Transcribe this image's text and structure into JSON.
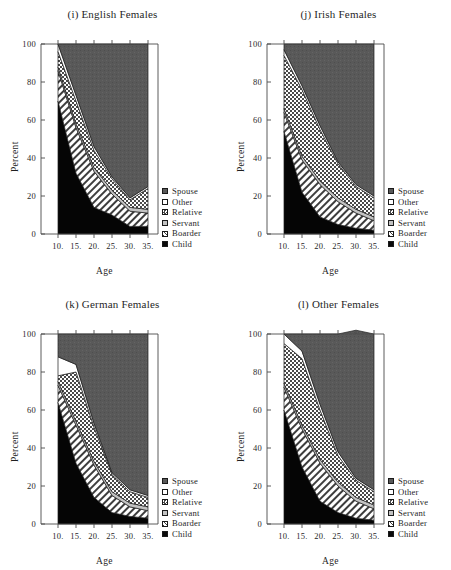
{
  "figure": {
    "ylabel": "Percent",
    "xlabel": "Age",
    "y_ticks": [
      "0",
      "20",
      "40",
      "60",
      "80",
      "100"
    ],
    "x_ticks": [
      "10.",
      "15.",
      "20.",
      "25.",
      "30.",
      "35."
    ],
    "legend": [
      {
        "label": "Spouse",
        "pattern": "solid-dark",
        "color": "#595959"
      },
      {
        "label": "Other",
        "pattern": "empty",
        "color": "#ffffff"
      },
      {
        "label": "Relative",
        "pattern": "checker",
        "color": "#d9d9d9"
      },
      {
        "label": "Servant",
        "pattern": "hatch-light",
        "color": "#cccccc"
      },
      {
        "label": "Boarder",
        "pattern": "hatch-diag",
        "color": "#e0e0e0"
      },
      {
        "label": "Child",
        "pattern": "solid-black",
        "color": "#000000"
      }
    ]
  },
  "chart_data": [
    {
      "type": "area",
      "title": "(i) English Females",
      "xlabel": "Age",
      "ylabel": "Percent",
      "x": [
        10,
        15,
        20,
        25,
        30,
        35
      ],
      "xlim": [
        10,
        35
      ],
      "ylim": [
        0,
        100
      ],
      "grid": false,
      "legend_position": "right",
      "series": [
        {
          "name": "Child",
          "values": [
            70,
            32,
            14,
            10,
            4,
            4
          ]
        },
        {
          "name": "Boarder",
          "values": [
            16,
            24,
            19,
            11,
            8,
            7
          ]
        },
        {
          "name": "Servant",
          "values": [
            2,
            2,
            2,
            2,
            2,
            2
          ]
        },
        {
          "name": "Relative",
          "values": [
            8,
            12,
            9,
            6,
            4,
            11
          ]
        },
        {
          "name": "Other",
          "values": [
            4,
            3,
            2,
            1,
            1,
            1
          ]
        },
        {
          "name": "Spouse",
          "values": [
            0,
            27,
            54,
            70,
            81,
            75
          ]
        }
      ]
    },
    {
      "type": "area",
      "title": "(j) Irish Females",
      "xlabel": "Age",
      "ylabel": "Percent",
      "x": [
        10,
        15,
        20,
        25,
        30,
        35
      ],
      "xlim": [
        10,
        35
      ],
      "ylim": [
        0,
        100
      ],
      "grid": false,
      "legend_position": "right",
      "series": [
        {
          "name": "Child",
          "values": [
            54,
            22,
            9,
            5,
            3,
            2
          ]
        },
        {
          "name": "Boarder",
          "values": [
            10,
            17,
            17,
            12,
            8,
            5
          ]
        },
        {
          "name": "Servant",
          "values": [
            2,
            2,
            2,
            2,
            2,
            2
          ]
        },
        {
          "name": "Relative",
          "values": [
            28,
            35,
            27,
            18,
            12,
            10
          ]
        },
        {
          "name": "Other",
          "values": [
            3,
            2,
            2,
            1,
            1,
            1
          ]
        },
        {
          "name": "Spouse",
          "values": [
            3,
            22,
            43,
            62,
            74,
            80
          ]
        }
      ]
    },
    {
      "type": "area",
      "title": "(k) German Females",
      "xlabel": "Age",
      "ylabel": "Percent",
      "x": [
        10,
        15,
        20,
        25,
        30,
        35
      ],
      "xlim": [
        10,
        35
      ],
      "ylim": [
        0,
        100
      ],
      "grid": false,
      "legend_position": "right",
      "series": [
        {
          "name": "Child",
          "values": [
            64,
            32,
            14,
            6,
            4,
            3
          ]
        },
        {
          "name": "Boarder",
          "values": [
            9,
            20,
            17,
            9,
            5,
            4
          ]
        },
        {
          "name": "Servant",
          "values": [
            2,
            2,
            2,
            2,
            2,
            2
          ]
        },
        {
          "name": "Relative",
          "values": [
            3,
            26,
            18,
            9,
            6,
            5
          ]
        },
        {
          "name": "Other",
          "values": [
            10,
            4,
            2,
            1,
            1,
            1
          ]
        },
        {
          "name": "Spouse",
          "values": [
            12,
            16,
            47,
            73,
            82,
            85
          ]
        }
      ]
    },
    {
      "type": "area",
      "title": "(l) Other Females",
      "xlabel": "Age",
      "ylabel": "Percent",
      "x": [
        10,
        15,
        20,
        25,
        30,
        35
      ],
      "xlim": [
        10,
        35
      ],
      "ylim": [
        0,
        100
      ],
      "grid": false,
      "legend_position": "right",
      "series": [
        {
          "name": "Child",
          "values": [
            60,
            30,
            12,
            6,
            3,
            2
          ]
        },
        {
          "name": "Boarder",
          "values": [
            12,
            20,
            20,
            14,
            9,
            6
          ]
        },
        {
          "name": "Servant",
          "values": [
            2,
            2,
            2,
            2,
            2,
            2
          ]
        },
        {
          "name": "Relative",
          "values": [
            21,
            35,
            26,
            14,
            9,
            7
          ]
        },
        {
          "name": "Other",
          "values": [
            5,
            4,
            3,
            2,
            1,
            1
          ]
        },
        {
          "name": "Spouse",
          "values": [
            0,
            9,
            37,
            62,
            78,
            82
          ]
        }
      ]
    }
  ]
}
